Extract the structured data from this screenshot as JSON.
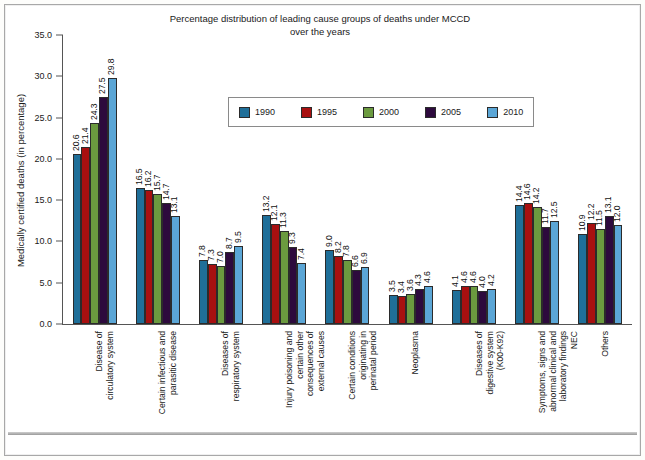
{
  "chart_data": {
    "type": "bar",
    "title": "Percentage distribution of leading cause groups of deaths under MCCD over the years",
    "title_line1": "Percentage distribution of leading cause groups of deaths under MCCD",
    "title_line2": "over the years",
    "xlabel": "",
    "ylabel": "Medically certified deaths (in percentage)",
    "ylim": [
      0,
      35
    ],
    "ytick_labels": [
      "35.0",
      "30.0",
      "25.0",
      "20.0",
      "15.0",
      "10.0",
      "5.0",
      "0.0"
    ],
    "ytick_values": [
      35,
      30,
      25,
      20,
      15,
      10,
      5,
      0
    ],
    "grid": false,
    "legend_position": "upper-center",
    "categories": [
      "Disease of\ncirculatory system",
      "Certain infectious and\nparasitic disease",
      "Diseases of\nrespiratory system",
      "Injury poisoning and\ncertain other\nconsequences of\nexternal causes",
      "Certain conditions\noriginating in\nperinatal period",
      "Neoplasma",
      "Diseases of\ndigestive system\n(K00-K92)",
      "Symptoms, signs and\nabnormal clinical and\nlaboratory findings\nNEC",
      "Others"
    ],
    "series": [
      {
        "name": "1990",
        "color": "#1f6f99",
        "values": [
          20.6,
          16.5,
          7.8,
          13.2,
          9.0,
          3.5,
          4.1,
          14.4,
          10.9
        ]
      },
      {
        "name": "1995",
        "color": "#a81010",
        "values": [
          21.4,
          16.2,
          7.3,
          12.1,
          8.2,
          3.4,
          4.6,
          14.6,
          12.2
        ]
      },
      {
        "name": "2000",
        "color": "#6b9a3f",
        "values": [
          24.3,
          15.7,
          7.0,
          11.3,
          7.8,
          3.6,
          4.6,
          14.2,
          11.5
        ]
      },
      {
        "name": "2005",
        "color": "#2d0a3d",
        "values": [
          27.5,
          14.7,
          8.7,
          9.3,
          6.6,
          4.3,
          4.0,
          11.7,
          13.1
        ]
      },
      {
        "name": "2010",
        "color": "#5ba6d6",
        "values": [
          29.8,
          13.1,
          9.5,
          7.4,
          6.9,
          4.6,
          4.2,
          12.5,
          12.0
        ]
      }
    ]
  }
}
